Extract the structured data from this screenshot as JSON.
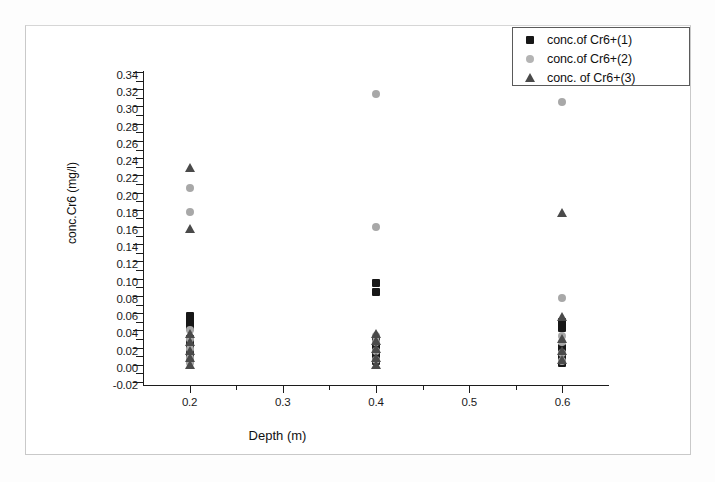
{
  "chart_data": {
    "type": "scatter",
    "title": "",
    "xlabel": "Depth (m)",
    "ylabel": "conc.Cr6 (mg/l)",
    "xlim": [
      0.15,
      0.65
    ],
    "ylim": [
      -0.02,
      0.34
    ],
    "xticks": [
      "0.2",
      "0.3",
      "0.4",
      "0.5",
      "0.6"
    ],
    "xtick_values": [
      0.2,
      0.3,
      0.4,
      0.5,
      0.6
    ],
    "yticks": [
      "-0.02",
      "0.00",
      "0.02",
      "0.04",
      "0.06",
      "0.08",
      "0.10",
      "0.12",
      "0.14",
      "0.16",
      "0.18",
      "0.20",
      "0.22",
      "0.24",
      "0.26",
      "0.28",
      "0.30",
      "0.32",
      "0.34"
    ],
    "ytick_values": [
      -0.02,
      0.0,
      0.02,
      0.04,
      0.06,
      0.08,
      0.1,
      0.12,
      0.14,
      0.16,
      0.18,
      0.2,
      0.22,
      0.24,
      0.26,
      0.28,
      0.3,
      0.32,
      0.34
    ],
    "grid": false,
    "legend_position": "top-right",
    "series": [
      {
        "name": "conc.of Cr6+(1)",
        "marker": "square",
        "color": "#171717",
        "points": [
          {
            "x": 0.2,
            "y": 0.057
          },
          {
            "x": 0.2,
            "y": 0.05
          },
          {
            "x": 0.2,
            "y": 0.044
          },
          {
            "x": 0.2,
            "y": 0.03
          },
          {
            "x": 0.2,
            "y": 0.022
          },
          {
            "x": 0.2,
            "y": 0.014
          },
          {
            "x": 0.2,
            "y": 0.006
          },
          {
            "x": 0.4,
            "y": 0.095
          },
          {
            "x": 0.4,
            "y": 0.084
          },
          {
            "x": 0.4,
            "y": 0.03
          },
          {
            "x": 0.4,
            "y": 0.022
          },
          {
            "x": 0.4,
            "y": 0.012
          },
          {
            "x": 0.4,
            "y": 0.004
          },
          {
            "x": 0.6,
            "y": 0.05
          },
          {
            "x": 0.6,
            "y": 0.043
          },
          {
            "x": 0.6,
            "y": 0.02
          },
          {
            "x": 0.6,
            "y": 0.01
          },
          {
            "x": 0.6,
            "y": 0.002
          }
        ]
      },
      {
        "name": "conc.of Cr6+(2)",
        "marker": "circle",
        "color": "#a8a8a8",
        "points": [
          {
            "x": 0.2,
            "y": 0.205
          },
          {
            "x": 0.2,
            "y": 0.177
          },
          {
            "x": 0.2,
            "y": 0.04
          },
          {
            "x": 0.2,
            "y": 0.03
          },
          {
            "x": 0.2,
            "y": 0.018
          },
          {
            "x": 0.2,
            "y": 0.008
          },
          {
            "x": 0.2,
            "y": 0.002
          },
          {
            "x": 0.4,
            "y": 0.315
          },
          {
            "x": 0.4,
            "y": 0.16
          },
          {
            "x": 0.4,
            "y": 0.034
          },
          {
            "x": 0.4,
            "y": 0.026
          },
          {
            "x": 0.4,
            "y": 0.016
          },
          {
            "x": 0.4,
            "y": 0.006
          },
          {
            "x": 0.6,
            "y": 0.305
          },
          {
            "x": 0.6,
            "y": 0.078
          },
          {
            "x": 0.6,
            "y": 0.034
          },
          {
            "x": 0.6,
            "y": 0.026
          },
          {
            "x": 0.6,
            "y": 0.014
          },
          {
            "x": 0.6,
            "y": 0.004
          }
        ]
      },
      {
        "name": "conc. of Cr6+(3)",
        "marker": "triangle",
        "color": "#4a4a4a",
        "points": [
          {
            "x": 0.2,
            "y": 0.228
          },
          {
            "x": 0.2,
            "y": 0.158
          },
          {
            "x": 0.2,
            "y": 0.036
          },
          {
            "x": 0.2,
            "y": 0.026
          },
          {
            "x": 0.2,
            "y": 0.016
          },
          {
            "x": 0.2,
            "y": 0.008
          },
          {
            "x": 0.2,
            "y": 0.0
          },
          {
            "x": 0.4,
            "y": 0.036
          },
          {
            "x": 0.4,
            "y": 0.028
          },
          {
            "x": 0.4,
            "y": 0.018
          },
          {
            "x": 0.4,
            "y": 0.008
          },
          {
            "x": 0.4,
            "y": 0.0
          },
          {
            "x": 0.6,
            "y": 0.176
          },
          {
            "x": 0.6,
            "y": 0.056
          },
          {
            "x": 0.6,
            "y": 0.03
          },
          {
            "x": 0.6,
            "y": 0.016
          },
          {
            "x": 0.6,
            "y": 0.006
          }
        ]
      }
    ]
  }
}
